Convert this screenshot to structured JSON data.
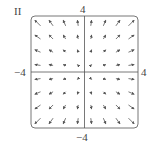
{
  "panel_label": "II",
  "axes": {
    "y_top": "4",
    "y_bottom": "−4",
    "x_left": "−4",
    "x_right": "4"
  },
  "chart_data": {
    "type": "vector_field",
    "title": "II",
    "field": "F(x, y) = (x, y)",
    "xlim": [
      -4,
      4
    ],
    "ylim": [
      -4,
      4
    ],
    "grid_points_per_axis": 8,
    "grid_values": [
      -3.5,
      -2.5,
      -1.5,
      -0.5,
      0.5,
      1.5,
      2.5,
      3.5
    ],
    "axis_tick_labels": {
      "x": [
        "−4",
        "4"
      ],
      "y": [
        "−4",
        "4"
      ]
    },
    "colors": {
      "arrow": "#555555",
      "frame": "#777777",
      "axis": "#555555"
    }
  }
}
